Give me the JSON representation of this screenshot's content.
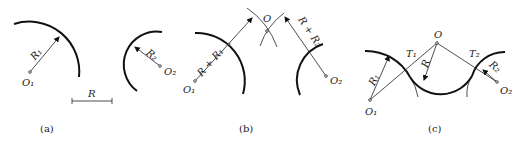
{
  "figure": {
    "parts": [
      {
        "caption": "(a)",
        "labels": {
          "center1": "O₁",
          "radius1": "R₁",
          "center2": "O₂",
          "radius2": "R₂",
          "scale": "R"
        }
      },
      {
        "caption": "(b)",
        "labels": {
          "center1": "O₁",
          "dist1": "R + R₁",
          "center": "O",
          "dist2": "R + R₂",
          "center2": "O₂"
        }
      },
      {
        "caption": "(c)",
        "labels": {
          "center1": "O₁",
          "radius1": "R₁",
          "tangent1": "T₁",
          "center": "O",
          "radius": "R",
          "tangent2": "T₂",
          "radius2": "R₂",
          "center2": "O₂"
        }
      }
    ]
  }
}
